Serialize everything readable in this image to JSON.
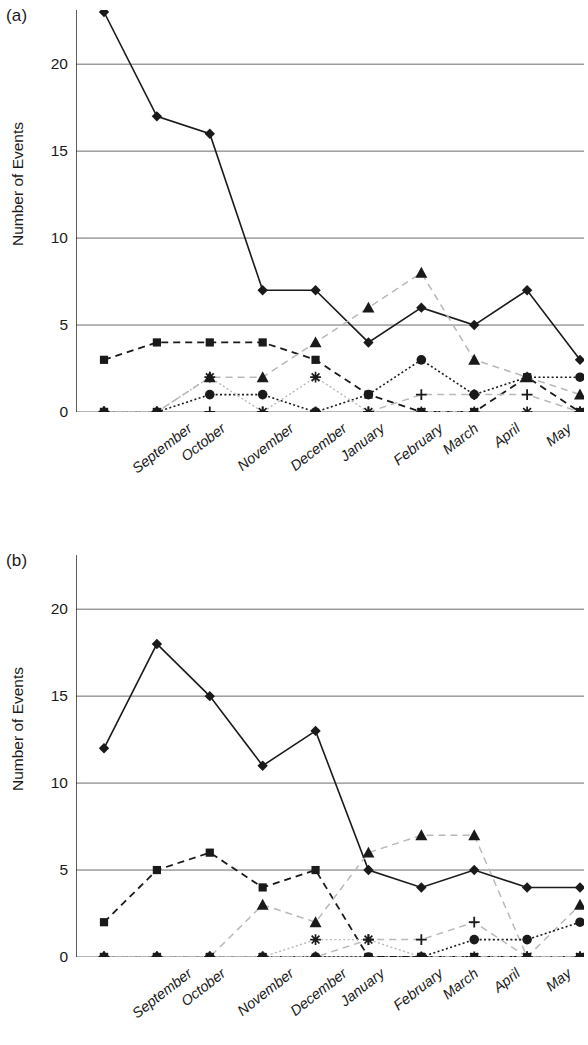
{
  "figure": {
    "panels": [
      {
        "key": "a",
        "label": "(a)"
      },
      {
        "key": "b",
        "label": "(b)"
      }
    ]
  },
  "chart_data": [
    {
      "panel": "(a)",
      "type": "line",
      "title": "",
      "xlabel": "",
      "ylabel": "Number of Events",
      "categories": [
        "September",
        "October",
        "November",
        "December",
        "January",
        "February",
        "March",
        "April",
        "May",
        "June"
      ],
      "ylim": [
        0,
        23
      ],
      "yticks": [
        0,
        5,
        10,
        15,
        20
      ],
      "ytick_labels": [
        "0",
        "5",
        "10",
        "15",
        "20"
      ],
      "grid": "horizontal",
      "legend": "none",
      "series": [
        {
          "name": "diamond-solid",
          "marker": "diamond",
          "line": "solid",
          "values": [
            23,
            17,
            16,
            7,
            7,
            4,
            6,
            5,
            7,
            3
          ]
        },
        {
          "name": "square-dashed",
          "marker": "square",
          "line": "dashed",
          "values": [
            3,
            4,
            4,
            4,
            3,
            1,
            0,
            0,
            2,
            0
          ]
        },
        {
          "name": "triangle-dashed",
          "marker": "triangle",
          "line": "dashed-light",
          "values": [
            0,
            0,
            2,
            2,
            4,
            6,
            8,
            3,
            2,
            1
          ]
        },
        {
          "name": "circle-dotted",
          "marker": "circle",
          "line": "dotted",
          "values": [
            0,
            0,
            1,
            1,
            0,
            1,
            3,
            1,
            2,
            2
          ]
        },
        {
          "name": "plus-dashed",
          "marker": "plus",
          "line": "dashed-light",
          "values": [
            0,
            0,
            0,
            0,
            0,
            0,
            1,
            1,
            1,
            0
          ]
        },
        {
          "name": "star-dotted",
          "marker": "star",
          "line": "dotted-light",
          "values": [
            0,
            0,
            2,
            0,
            2,
            0,
            0,
            0,
            0,
            0
          ]
        }
      ]
    },
    {
      "panel": "(b)",
      "type": "line",
      "title": "",
      "xlabel": "",
      "ylabel": "Number of Events",
      "categories": [
        "September",
        "October",
        "November",
        "December",
        "January",
        "February",
        "March",
        "April",
        "May",
        "June"
      ],
      "ylim": [
        0,
        23
      ],
      "yticks": [
        0,
        5,
        10,
        15,
        20
      ],
      "ytick_labels": [
        "0",
        "5",
        "10",
        "15",
        "20"
      ],
      "grid": "horizontal",
      "legend": "none",
      "series": [
        {
          "name": "diamond-solid",
          "marker": "diamond",
          "line": "solid",
          "values": [
            12,
            18,
            15,
            11,
            13,
            5,
            4,
            5,
            4,
            4
          ]
        },
        {
          "name": "square-dashed",
          "marker": "square",
          "line": "dashed",
          "values": [
            2,
            5,
            6,
            4,
            5,
            0,
            0,
            0,
            0,
            0
          ]
        },
        {
          "name": "triangle-dashed",
          "marker": "triangle",
          "line": "dashed-light",
          "values": [
            0,
            0,
            0,
            3,
            2,
            6,
            7,
            7,
            0,
            3
          ]
        },
        {
          "name": "circle-dotted",
          "marker": "circle",
          "line": "dotted",
          "values": [
            0,
            0,
            0,
            0,
            0,
            0,
            0,
            1,
            1,
            2
          ]
        },
        {
          "name": "plus-dashed",
          "marker": "plus",
          "line": "dashed-light",
          "values": [
            0,
            0,
            0,
            0,
            0,
            1,
            1,
            2,
            0,
            0
          ]
        },
        {
          "name": "star-dotted",
          "marker": "star",
          "line": "dotted-light",
          "values": [
            0,
            0,
            0,
            0,
            1,
            1,
            0,
            0,
            0,
            0
          ]
        }
      ]
    }
  ],
  "colors": {
    "ink": "#1a1a1a",
    "grid": "#6b6b6b",
    "light": "#b9b9b9"
  }
}
